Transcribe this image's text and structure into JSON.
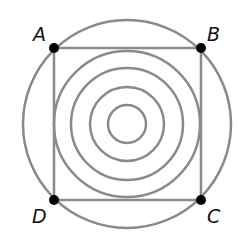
{
  "diagram": {
    "center": [
      127,
      124
    ],
    "outer_circle_radius": 104,
    "inner_circle_radii": [
      73,
      56,
      37,
      19
    ],
    "line_color": "#8a8a8a",
    "point_color": "#000000",
    "points": [
      {
        "label": "A",
        "x": 54,
        "y": 48,
        "lx": 34,
        "ly": 40
      },
      {
        "label": "B",
        "x": 201,
        "y": 48,
        "lx": 208,
        "ly": 40
      },
      {
        "label": "C",
        "x": 201,
        "y": 200,
        "lx": 208,
        "ly": 222
      },
      {
        "label": "D",
        "x": 54,
        "y": 200,
        "lx": 32,
        "ly": 222
      }
    ]
  }
}
